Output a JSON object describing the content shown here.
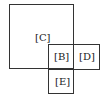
{
  "diagram": {
    "stroke_color": "#333333",
    "boxes": [
      {
        "id": "C",
        "label": "[C]",
        "x": 9,
        "y": 4,
        "w": 65,
        "h": 65,
        "label_x": 35,
        "label_y": 33
      },
      {
        "id": "B",
        "label": "[B]",
        "x": 48,
        "y": 44,
        "w": 25,
        "h": 25,
        "label_x": 54,
        "label_y": 52
      },
      {
        "id": "D",
        "label": "[D]",
        "x": 73,
        "y": 44,
        "w": 27,
        "h": 25,
        "label_x": 80,
        "label_y": 52
      },
      {
        "id": "E",
        "label": "[E]",
        "x": 48,
        "y": 69,
        "w": 25,
        "h": 25,
        "label_x": 55,
        "label_y": 77
      }
    ]
  }
}
